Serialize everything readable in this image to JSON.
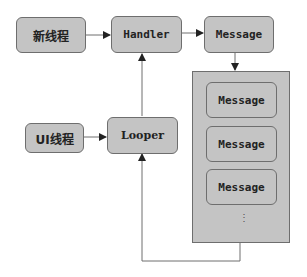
{
  "diagram": {
    "nodes": {
      "new_thread": "新线程",
      "handler": "Handler",
      "message": "Message",
      "ui_thread": "UI线程",
      "looper": "Looper"
    },
    "queue": {
      "messages": [
        "Message",
        "Message",
        "Message"
      ],
      "ellipsis": "⋮"
    },
    "edges": [
      {
        "from": "新线程",
        "to": "Handler"
      },
      {
        "from": "Handler",
        "to": "Message"
      },
      {
        "from": "Message",
        "to": "MessageQueue"
      },
      {
        "from": "UI线程",
        "to": "Looper"
      },
      {
        "from": "Looper",
        "to": "Handler"
      },
      {
        "from": "MessageQueue",
        "to": "Looper"
      }
    ],
    "colors": {
      "box_fill": "#c4c4c4",
      "box_border": "#6e6e6e",
      "line": "#6e6e6e"
    }
  }
}
